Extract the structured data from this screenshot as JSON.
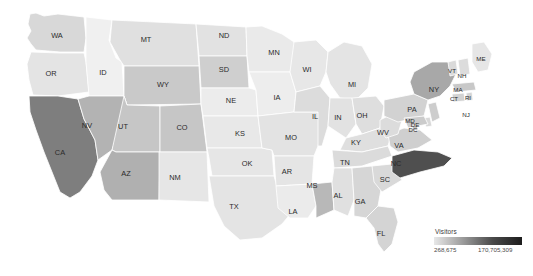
{
  "legend": {
    "title": "Visitors",
    "min_label": "268,675",
    "max_label": "170,705,309",
    "min_value": 268675,
    "max_value": 170705309,
    "ramp_low_color": "#e8e8e8",
    "ramp_high_color": "#1d1d1d",
    "position": "bottom-right"
  },
  "chart_data": {
    "type": "heatmap",
    "subtype": "choropleth-map-usa",
    "title": "",
    "xlabel": "",
    "ylabel": "",
    "value_label": "Visitors",
    "color_scale": "sequential-grayscale",
    "vmin": 268675,
    "vmax": 170705309,
    "legend_min_label": "268,675",
    "legend_max_label": "170,705,309",
    "grid": false,
    "categories": [
      "WA",
      "OR",
      "ID",
      "MT",
      "WY",
      "CA",
      "NV",
      "UT",
      "AZ",
      "CO",
      "NM",
      "ND",
      "SD",
      "NE",
      "KS",
      "OK",
      "TX",
      "MN",
      "IA",
      "MO",
      "AR",
      "LA",
      "WI",
      "IL",
      "MS",
      "MI",
      "IN",
      "OH",
      "KY",
      "TN",
      "AL",
      "GA",
      "FL",
      "SC",
      "NC",
      "VA",
      "WV",
      "PA",
      "NY",
      "ME",
      "VT",
      "NH",
      "MA",
      "RI",
      "CT",
      "NJ",
      "DE",
      "MD",
      "DC"
    ],
    "series": [
      {
        "name": "Visitors",
        "values": [
          12500000,
          6800000,
          3200000,
          3900000,
          7400000,
          170705309,
          41000000,
          9800000,
          36000000,
          11500000,
          5200000,
          1600000,
          22000000,
          5400000,
          6100000,
          6900000,
          14500000,
          8700000,
          4300000,
          9600000,
          5100000,
          6200000,
          7800000,
          13800000,
          40000000,
          9100000,
          7200000,
          12900000,
          8300000,
          10400000,
          7600000,
          15800000,
          17200000,
          9400000,
          152000000,
          16900000,
          4100000,
          21500000,
          62000000,
          2600000,
          1400000,
          1500000,
          14200000,
          1200000,
          6400000,
          11800000,
          900000,
          13600000,
          268675
        ]
      }
    ],
    "states": [
      {
        "code": "WA",
        "name": "Washington",
        "value": 12500000,
        "shade": "#d8d8d8"
      },
      {
        "code": "OR",
        "name": "Oregon",
        "value": 6800000,
        "shade": "#e4e4e4"
      },
      {
        "code": "ID",
        "name": "Idaho",
        "value": 3200000,
        "shade": "#f0f0f0"
      },
      {
        "code": "MT",
        "name": "Montana",
        "value": 3900000,
        "shade": "#e0e0e0"
      },
      {
        "code": "WY",
        "name": "Wyoming",
        "value": 7400000,
        "shade": "#c9c9c9"
      },
      {
        "code": "CA",
        "name": "California",
        "value": 170705309,
        "shade": "#7e7e7e"
      },
      {
        "code": "NV",
        "name": "Nevada",
        "value": 41000000,
        "shade": "#b3b3b3"
      },
      {
        "code": "UT",
        "name": "Utah",
        "value": 9800000,
        "shade": "#c6c6c6"
      },
      {
        "code": "AZ",
        "name": "Arizona",
        "value": 36000000,
        "shade": "#b0b0b0"
      },
      {
        "code": "CO",
        "name": "Colorado",
        "value": 11500000,
        "shade": "#c6c6c6"
      },
      {
        "code": "NM",
        "name": "New Mexico",
        "value": 5200000,
        "shade": "#e6e6e6"
      },
      {
        "code": "ND",
        "name": "North Dakota",
        "value": 1600000,
        "shade": "#e2e2e2"
      },
      {
        "code": "SD",
        "name": "South Dakota",
        "value": 22000000,
        "shade": "#cfcfcf"
      },
      {
        "code": "NE",
        "name": "Nebraska",
        "value": 5400000,
        "shade": "#ececec"
      },
      {
        "code": "KS",
        "name": "Kansas",
        "value": 6100000,
        "shade": "#e8e8e8"
      },
      {
        "code": "OK",
        "name": "Oklahoma",
        "value": 6900000,
        "shade": "#e6e6e6"
      },
      {
        "code": "TX",
        "name": "Texas",
        "value": 14500000,
        "shade": "#e4e4e4"
      },
      {
        "code": "MN",
        "name": "Minnesota",
        "value": 8700000,
        "shade": "#eaeaea"
      },
      {
        "code": "IA",
        "name": "Iowa",
        "value": 4300000,
        "shade": "#ededed"
      },
      {
        "code": "MO",
        "name": "Missouri",
        "value": 9600000,
        "shade": "#e3e3e3"
      },
      {
        "code": "AR",
        "name": "Arkansas",
        "value": 5100000,
        "shade": "#e5e5e5"
      },
      {
        "code": "LA",
        "name": "Louisiana",
        "value": 6200000,
        "shade": "#ebebeb"
      },
      {
        "code": "WI",
        "name": "Wisconsin",
        "value": 7800000,
        "shade": "#e7e7e7"
      },
      {
        "code": "IL",
        "name": "Illinois",
        "value": 13800000,
        "shade": "#dcdcdc"
      },
      {
        "code": "MS",
        "name": "Mississippi",
        "value": 40000000,
        "shade": "#b8b8b8"
      },
      {
        "code": "MI",
        "name": "Michigan",
        "value": 9100000,
        "shade": "#e4e4e4"
      },
      {
        "code": "IN",
        "name": "Indiana",
        "value": 7200000,
        "shade": "#e2e2e2"
      },
      {
        "code": "OH",
        "name": "Ohio",
        "value": 12900000,
        "shade": "#dedede"
      },
      {
        "code": "KY",
        "name": "Kentucky",
        "value": 8300000,
        "shade": "#dfdfdf"
      },
      {
        "code": "TN",
        "name": "Tennessee",
        "value": 10400000,
        "shade": "#dbdbdb"
      },
      {
        "code": "AL",
        "name": "Alabama",
        "value": 7600000,
        "shade": "#e0e0e0"
      },
      {
        "code": "GA",
        "name": "Georgia",
        "value": 15800000,
        "shade": "#d6d6d6"
      },
      {
        "code": "FL",
        "name": "Florida",
        "value": 17200000,
        "shade": "#d4d4d4"
      },
      {
        "code": "SC",
        "name": "South Carolina",
        "value": 9400000,
        "shade": "#d9d9d9"
      },
      {
        "code": "NC",
        "name": "North Carolina",
        "value": 152000000,
        "shade": "#4f4f4f"
      },
      {
        "code": "VA",
        "name": "Virginia",
        "value": 16900000,
        "shade": "#cfcfcf"
      },
      {
        "code": "WV",
        "name": "West Virginia",
        "value": 4100000,
        "shade": "#dcdcdc"
      },
      {
        "code": "PA",
        "name": "Pennsylvania",
        "value": 21500000,
        "shade": "#d2d2d2"
      },
      {
        "code": "NY",
        "name": "New York",
        "value": 62000000,
        "shade": "#a8a8a8"
      },
      {
        "code": "ME",
        "name": "Maine",
        "value": 2600000,
        "shade": "#e6e6e6"
      },
      {
        "code": "VT",
        "name": "Vermont",
        "value": 1400000,
        "shade": "#dadada"
      },
      {
        "code": "NH",
        "name": "New Hampshire",
        "value": 1500000,
        "shade": "#dcdcdc"
      },
      {
        "code": "MA",
        "name": "Massachusetts",
        "value": 14200000,
        "shade": "#c8c8c8"
      },
      {
        "code": "RI",
        "name": "Rhode Island",
        "value": 1200000,
        "shade": "#d5d5d5"
      },
      {
        "code": "CT",
        "name": "Connecticut",
        "value": 6400000,
        "shade": "#d2d2d2"
      },
      {
        "code": "NJ",
        "name": "New Jersey",
        "value": 11800000,
        "shade": "#cdcdcd"
      },
      {
        "code": "DE",
        "name": "Delaware",
        "value": 900000,
        "shade": "#d8d8d8"
      },
      {
        "code": "MD",
        "name": "Maryland",
        "value": 13600000,
        "shade": "#cbcbcb"
      },
      {
        "code": "DC",
        "name": "District of Columbia",
        "value": 268675,
        "shade": "#c4c4c4"
      }
    ],
    "labels": [
      {
        "code": "WA",
        "x": 57,
        "y": 36
      },
      {
        "code": "OR",
        "x": 51,
        "y": 74
      },
      {
        "code": "ID",
        "x": 103,
        "y": 73
      },
      {
        "code": "MT",
        "x": 146,
        "y": 40
      },
      {
        "code": "WY",
        "x": 163,
        "y": 85
      },
      {
        "code": "CA",
        "x": 60,
        "y": 153
      },
      {
        "code": "NV",
        "x": 87,
        "y": 126
      },
      {
        "code": "UT",
        "x": 123,
        "y": 127
      },
      {
        "code": "AZ",
        "x": 126,
        "y": 174
      },
      {
        "code": "CO",
        "x": 182,
        "y": 128
      },
      {
        "code": "NM",
        "x": 175,
        "y": 178
      },
      {
        "code": "ND",
        "x": 224,
        "y": 36
      },
      {
        "code": "SD",
        "x": 224,
        "y": 70
      },
      {
        "code": "NE",
        "x": 231,
        "y": 101
      },
      {
        "code": "KS",
        "x": 240,
        "y": 134
      },
      {
        "code": "OK",
        "x": 247,
        "y": 164
      },
      {
        "code": "TX",
        "x": 234,
        "y": 207
      },
      {
        "code": "MN",
        "x": 274,
        "y": 53
      },
      {
        "code": "IA",
        "x": 277,
        "y": 98
      },
      {
        "code": "MO",
        "x": 291,
        "y": 138
      },
      {
        "code": "AR",
        "x": 287,
        "y": 172
      },
      {
        "code": "LA",
        "x": 293,
        "y": 212
      },
      {
        "code": "WI",
        "x": 307,
        "y": 70
      },
      {
        "code": "IL",
        "x": 315,
        "y": 117
      },
      {
        "code": "MS",
        "x": 312,
        "y": 186
      },
      {
        "code": "MI",
        "x": 352,
        "y": 85
      },
      {
        "code": "IN",
        "x": 338,
        "y": 118
      },
      {
        "code": "OH",
        "x": 362,
        "y": 116
      },
      {
        "code": "KY",
        "x": 356,
        "y": 143
      },
      {
        "code": "TN",
        "x": 345,
        "y": 163
      },
      {
        "code": "AL",
        "x": 338,
        "y": 196
      },
      {
        "code": "GA",
        "x": 360,
        "y": 202
      },
      {
        "code": "FL",
        "x": 381,
        "y": 234
      },
      {
        "code": "SC",
        "x": 385,
        "y": 180
      },
      {
        "code": "NC",
        "x": 396,
        "y": 164
      },
      {
        "code": "VA",
        "x": 399,
        "y": 146
      },
      {
        "code": "WV",
        "x": 383,
        "y": 133
      },
      {
        "code": "PA",
        "x": 412,
        "y": 110
      },
      {
        "code": "NY",
        "x": 434,
        "y": 90
      },
      {
        "code": "ME",
        "x": 481,
        "y": 59
      },
      {
        "code": "VT",
        "x": 452,
        "y": 71
      },
      {
        "code": "NH",
        "x": 462,
        "y": 76
      },
      {
        "code": "MA",
        "x": 458,
        "y": 90
      },
      {
        "code": "CT",
        "x": 454,
        "y": 99
      },
      {
        "code": "RI",
        "x": 468,
        "y": 98
      },
      {
        "code": "NJ",
        "x": 466,
        "y": 115
      },
      {
        "code": "DE",
        "x": 415,
        "y": 125
      },
      {
        "code": "MD",
        "x": 410,
        "y": 121
      },
      {
        "code": "DC",
        "x": 413,
        "y": 130
      }
    ]
  }
}
